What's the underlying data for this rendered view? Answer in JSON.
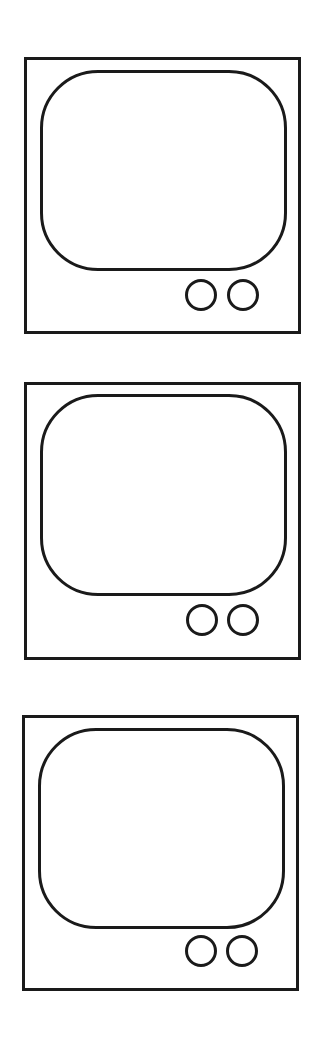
{
  "figure": {
    "stroke_color": "#1a1a1a",
    "background_color": "#ffffff",
    "tvs": [
      {
        "label": "tv-1",
        "frame": {
          "x": 24,
          "y": 57,
          "w": 277,
          "h": 277
        },
        "screen": {
          "x": 40,
          "y": 70,
          "w": 247,
          "h": 201,
          "radius": 58
        },
        "knobs": [
          {
            "cx": 201,
            "cy": 295,
            "d": 32
          },
          {
            "cx": 243,
            "cy": 295,
            "d": 32
          }
        ]
      },
      {
        "label": "tv-2",
        "frame": {
          "x": 24,
          "y": 382,
          "w": 277,
          "h": 278
        },
        "screen": {
          "x": 40,
          "y": 394,
          "w": 247,
          "h": 202,
          "radius": 58
        },
        "knobs": [
          {
            "cx": 202,
            "cy": 620,
            "d": 32
          },
          {
            "cx": 243,
            "cy": 620,
            "d": 32
          }
        ]
      },
      {
        "label": "tv-3",
        "frame": {
          "x": 22,
          "y": 715,
          "w": 277,
          "h": 276
        },
        "screen": {
          "x": 38,
          "y": 728,
          "w": 247,
          "h": 201,
          "radius": 58
        },
        "knobs": [
          {
            "cx": 201,
            "cy": 951,
            "d": 32
          },
          {
            "cx": 242,
            "cy": 951,
            "d": 32
          }
        ]
      }
    ]
  }
}
